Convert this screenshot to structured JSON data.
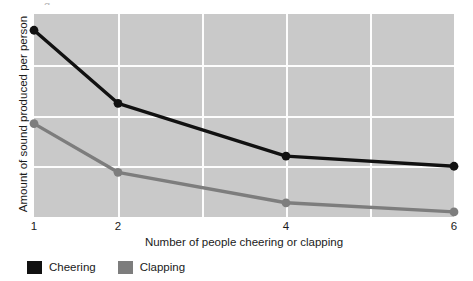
{
  "figure": {
    "top_artifact_text": "g",
    "plot_background_color": "#c9c9c9",
    "gridline_color": "#fdfdfd"
  },
  "chart_data": {
    "type": "line",
    "title": "",
    "xlabel": "Number of people cheering or clapping",
    "ylabel": "Amount of sound produced per person",
    "x": [
      1,
      2,
      4,
      6
    ],
    "xtick_labels": [
      "1",
      "2",
      "4",
      "6"
    ],
    "x_positions_pct": [
      0,
      20,
      60,
      100
    ],
    "ylim": [
      0,
      100
    ],
    "y_axis_ticks_shown": false,
    "grid": {
      "vertical_lines_pct": [
        20,
        40,
        60,
        80
      ],
      "horizontal_lines_pct": [
        25,
        50,
        75
      ],
      "enabled": true
    },
    "legend_position": "below-left",
    "series": [
      {
        "name": "Cheering",
        "color": "#111111",
        "values": [
          92,
          56,
          30,
          25
        ]
      },
      {
        "name": "Clapping",
        "color": "#7d7d7d",
        "values": [
          46,
          22,
          7,
          2.5
        ]
      }
    ]
  },
  "legend": {
    "items": [
      {
        "label": "Cheering",
        "color": "#111111"
      },
      {
        "label": "Clapping",
        "color": "#7d7d7d"
      }
    ]
  }
}
